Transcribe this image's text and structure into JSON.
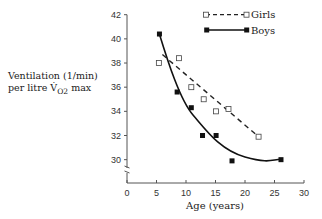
{
  "chart_data": {
    "type": "scatter",
    "title": "",
    "xlabel": "Age (years)",
    "ylabel": "Ventilation (l/min) per litre V̇O2 max",
    "ylabel_line1": "Ventilation (1/min)",
    "ylabel_line2_prefix": "per litre V̇",
    "ylabel_line2_sub": "O2",
    "ylabel_line2_suffix": " max",
    "xlim": [
      0,
      30
    ],
    "ylim": [
      29,
      42
    ],
    "y_axis_break": true,
    "xticks": [
      "0",
      "5",
      "10",
      "15",
      "20",
      "25",
      "30"
    ],
    "yticks": [
      "30",
      "32",
      "34",
      "36",
      "38",
      "40",
      "42"
    ],
    "grid": false,
    "legend_position": "top-right",
    "series": [
      {
        "name": "Girls",
        "marker": "open-square",
        "line": "dashed-linear-fit",
        "x": [
          5.4,
          8.8,
          10.9,
          13.0,
          15.1,
          17.2,
          22.3
        ],
        "y": [
          38.0,
          38.4,
          36.0,
          35.0,
          34.0,
          34.2,
          31.9
        ],
        "fit_line": {
          "x": [
            6,
            22.3
          ],
          "y": [
            38.7,
            31.9
          ]
        }
      },
      {
        "name": "Boys",
        "marker": "filled-square",
        "line": "solid-curve-fit",
        "x": [
          5.5,
          8.5,
          10.9,
          12.8,
          15.1,
          17.8,
          26.1
        ],
        "y": [
          40.4,
          35.6,
          34.3,
          32.0,
          32.0,
          29.9,
          30.0
        ]
      }
    ]
  },
  "legend": {
    "girls": "Girls",
    "boys": "Boys"
  }
}
